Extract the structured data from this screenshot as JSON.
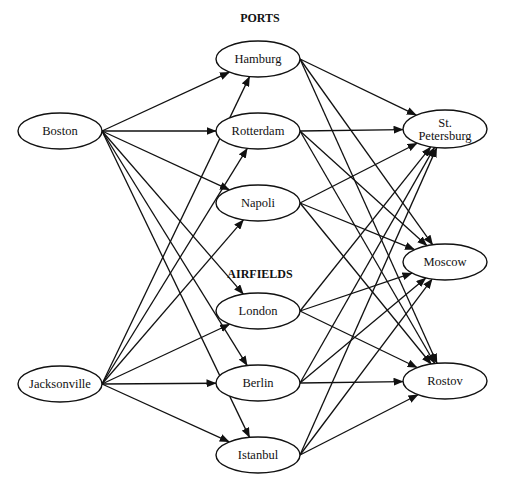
{
  "diagram": {
    "type": "directed-network",
    "group_labels": {
      "ports": "PORTS",
      "airfields": "AIRFIELDS"
    },
    "nodes": [
      {
        "id": "boston",
        "label": "Boston",
        "layer": "origin",
        "cx": 60,
        "cy": 131,
        "rx": 42,
        "ry": 18
      },
      {
        "id": "jacksonville",
        "label": "Jacksonville",
        "layer": "origin",
        "cx": 60,
        "cy": 384,
        "rx": 42,
        "ry": 18
      },
      {
        "id": "hamburg",
        "label": "Hamburg",
        "layer": "port",
        "cx": 258,
        "cy": 59,
        "rx": 42,
        "ry": 18
      },
      {
        "id": "rotterdam",
        "label": "Rotterdam",
        "layer": "port",
        "cx": 258,
        "cy": 131,
        "rx": 42,
        "ry": 18
      },
      {
        "id": "napoli",
        "label": "Napoli",
        "layer": "port",
        "cx": 258,
        "cy": 203,
        "rx": 42,
        "ry": 18
      },
      {
        "id": "london",
        "label": "London",
        "layer": "airfield",
        "cx": 258,
        "cy": 311,
        "rx": 42,
        "ry": 18
      },
      {
        "id": "berlin",
        "label": "Berlin",
        "layer": "airfield",
        "cx": 258,
        "cy": 383,
        "rx": 42,
        "ry": 18
      },
      {
        "id": "istanbul",
        "label": "Istanbul",
        "layer": "airfield",
        "cx": 258,
        "cy": 455,
        "rx": 42,
        "ry": 18
      },
      {
        "id": "st_petersburg",
        "label": "St.|Petersburg",
        "layer": "destination",
        "cx": 445,
        "cy": 129,
        "rx": 42,
        "ry": 19
      },
      {
        "id": "moscow",
        "label": "Moscow",
        "layer": "destination",
        "cx": 445,
        "cy": 262,
        "rx": 42,
        "ry": 18
      },
      {
        "id": "rostov",
        "label": "Rostov",
        "layer": "destination",
        "cx": 445,
        "cy": 381,
        "rx": 42,
        "ry": 18
      }
    ],
    "edges": [
      [
        "boston",
        "hamburg"
      ],
      [
        "boston",
        "rotterdam"
      ],
      [
        "boston",
        "napoli"
      ],
      [
        "boston",
        "london"
      ],
      [
        "boston",
        "berlin"
      ],
      [
        "boston",
        "istanbul"
      ],
      [
        "jacksonville",
        "hamburg"
      ],
      [
        "jacksonville",
        "rotterdam"
      ],
      [
        "jacksonville",
        "napoli"
      ],
      [
        "jacksonville",
        "london"
      ],
      [
        "jacksonville",
        "berlin"
      ],
      [
        "jacksonville",
        "istanbul"
      ],
      [
        "hamburg",
        "st_petersburg"
      ],
      [
        "hamburg",
        "moscow"
      ],
      [
        "hamburg",
        "rostov"
      ],
      [
        "rotterdam",
        "st_petersburg"
      ],
      [
        "rotterdam",
        "moscow"
      ],
      [
        "rotterdam",
        "rostov"
      ],
      [
        "napoli",
        "st_petersburg"
      ],
      [
        "napoli",
        "moscow"
      ],
      [
        "napoli",
        "rostov"
      ],
      [
        "london",
        "st_petersburg"
      ],
      [
        "london",
        "moscow"
      ],
      [
        "london",
        "rostov"
      ],
      [
        "berlin",
        "st_petersburg"
      ],
      [
        "berlin",
        "moscow"
      ],
      [
        "berlin",
        "rostov"
      ],
      [
        "istanbul",
        "st_petersburg"
      ],
      [
        "istanbul",
        "moscow"
      ],
      [
        "istanbul",
        "rostov"
      ]
    ]
  }
}
